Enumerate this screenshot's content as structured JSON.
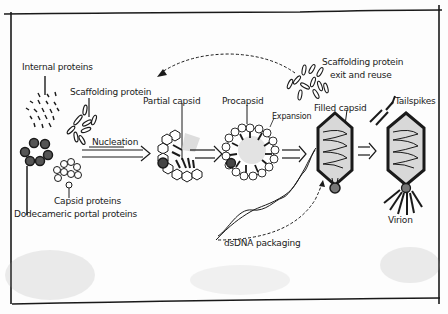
{
  "diagram": {
    "type": "phage assembly pathway sketch",
    "labels": {
      "internal_proteins": "Internal proteins",
      "scaffolding_protein": "Scaffolding protein",
      "nucleation": "Nucleation",
      "capsid_proteins": "Capsid proteins",
      "portal_proteins": "Dodecameric portal proteins",
      "partial_capsid": "Partial capsid",
      "procapsid": "Procapsid",
      "expansion": "Expansion",
      "scaffolding_exit_line1": "Scaffolding protein",
      "scaffolding_exit_line2": "exit and reuse",
      "filled_capsid": "Filled capsid",
      "tailspikes": "Tailspikes",
      "virion": "Virion",
      "dsdna_packaging": "dsDNA packaging"
    },
    "stages": [
      "Components",
      "Partial capsid",
      "Procapsid",
      "Filled capsid",
      "Virion"
    ],
    "arrows": [
      {
        "from": "Components",
        "to": "Partial capsid",
        "label": "Nucleation"
      },
      {
        "from": "Partial capsid",
        "to": "Procapsid"
      },
      {
        "from": "Procapsid",
        "to": "Filled capsid",
        "label": "Expansion"
      },
      {
        "from": "Filled capsid",
        "to": "Virion"
      },
      {
        "from": "Scaffolding protein exit",
        "to": "Scaffolding protein",
        "style": "dashed"
      },
      {
        "from": "dsDNA",
        "to": "Filled capsid",
        "style": "dashed"
      }
    ],
    "colors": {
      "ink": "#1a1a1a",
      "paper": "#fdfdfd",
      "capsid_fill": "#d8d8d8",
      "portal": "#555555"
    }
  }
}
